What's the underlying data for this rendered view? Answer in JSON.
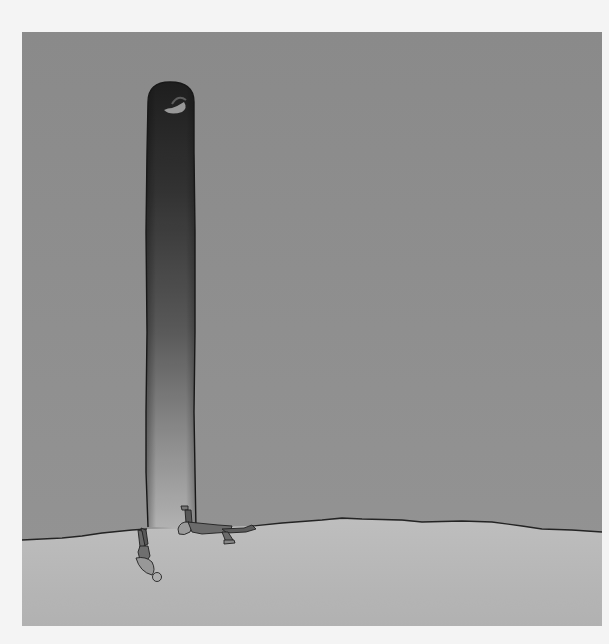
{
  "artwork": {
    "subject": "Illustration of a tall dark tunnel opening in a grey wall with two small figures emerging at the floor line",
    "colors": {
      "page_background": "#f4f4f4",
      "wall": "#8e8e8e",
      "wall_light": "#979797",
      "floor": "#b7b7b7",
      "floor_light": "#c4c4c4",
      "tunnel_top": "#1a1a1a",
      "tunnel_mid": "#3e3e3e",
      "tunnel_bottom": "#b2b2b2",
      "outline": "#1c1c1c"
    },
    "elements": {
      "tunnel": "tunnel",
      "hanging_figure": "hanging-figure",
      "crawling_figure": "crawling-figure",
      "floor_edge": "floor-edge"
    }
  }
}
